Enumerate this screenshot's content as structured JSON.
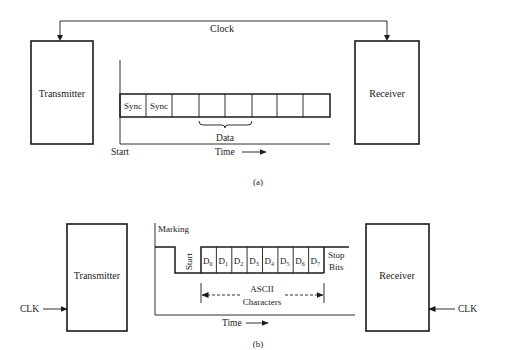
{
  "diagram_a": {
    "caption": "(a)",
    "transmitter_label": "Transmitter",
    "receiver_label": "Receiver",
    "clock_label": "Clock",
    "cells": [
      "Sync",
      "Sync",
      "",
      "",
      "",
      "",
      "",
      ""
    ],
    "data_label": "Data",
    "start_label": "Start",
    "time_label": "Time"
  },
  "diagram_b": {
    "caption": "(b)",
    "transmitter_label": "Transmitter",
    "receiver_label": "Receiver",
    "clk_left_label": "CLK",
    "clk_right_label": "CLK",
    "marking_label": "Marking",
    "start_label": "Start",
    "bits": [
      {
        "base": "D",
        "sub": "0"
      },
      {
        "base": "D",
        "sub": "1"
      },
      {
        "base": "D",
        "sub": "2"
      },
      {
        "base": "D",
        "sub": "3"
      },
      {
        "base": "D",
        "sub": "4"
      },
      {
        "base": "D",
        "sub": "5"
      },
      {
        "base": "D",
        "sub": "6"
      },
      {
        "base": "D",
        "sub": "7"
      }
    ],
    "stop_label_line1": "Stop",
    "stop_label_line2": "Bits",
    "ascii_label_line1": "ASCII",
    "ascii_label_line2": "Characters",
    "time_label": "Time"
  }
}
